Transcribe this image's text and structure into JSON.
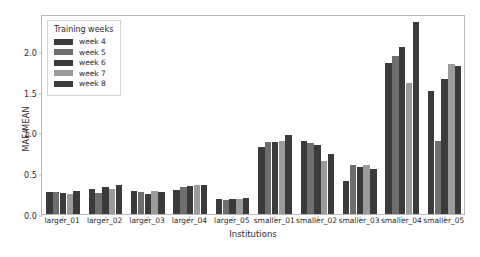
{
  "chart_data": {
    "type": "bar",
    "title": "",
    "xlabel": "Institutions",
    "ylabel": "MAE/MEAN",
    "ylim": [
      0.0,
      2.45
    ],
    "yticks": [
      "0.0",
      "0.5",
      "1.0",
      "1.5",
      "2.0"
    ],
    "ytick_values": [
      0.0,
      0.5,
      1.0,
      1.5,
      2.0
    ],
    "grid": false,
    "legend_title": "Training weeks",
    "legend_position": "upper left",
    "categories": [
      "larger_01",
      "larger_02",
      "larger_03",
      "larger_04",
      "larger_05",
      "smaller_01",
      "smaller_02",
      "smaller_03",
      "smaller_04",
      "smaller_05"
    ],
    "series": [
      {
        "name": "week 4",
        "color": "#3b3b3b",
        "values": [
          0.27,
          0.31,
          0.285,
          0.29,
          0.19,
          0.82,
          0.89,
          0.4,
          1.845,
          1.505
        ]
      },
      {
        "name": "week 5",
        "color": "#6e6e6e",
        "values": [
          0.265,
          0.26,
          0.27,
          0.335,
          0.175,
          0.885,
          0.875,
          0.6,
          1.93,
          0.89
        ]
      },
      {
        "name": "week 6",
        "color": "#3b3b3b",
        "values": [
          0.255,
          0.33,
          0.245,
          0.34,
          0.18,
          0.885,
          0.84,
          0.57,
          2.05,
          1.655
        ]
      },
      {
        "name": "week 7",
        "color": "#9b9b9b",
        "values": [
          0.25,
          0.305,
          0.28,
          0.35,
          0.18,
          0.89,
          0.65,
          0.595,
          1.6,
          1.84
        ]
      },
      {
        "name": "week 8",
        "color": "#3b3b3b",
        "values": [
          0.28,
          0.355,
          0.275,
          0.35,
          0.195,
          0.965,
          0.74,
          0.55,
          2.35,
          1.815
        ]
      }
    ]
  }
}
